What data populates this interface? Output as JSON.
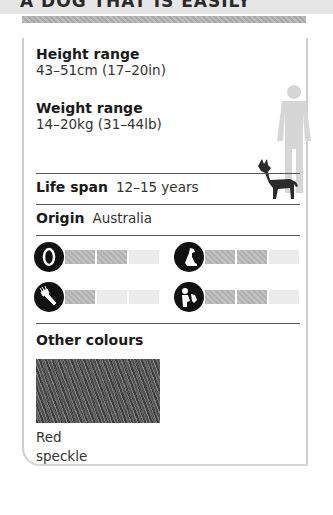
{
  "header": {
    "title_partial": "A DOG THAT IS EASILY"
  },
  "card": {
    "height_range": {
      "label": "Height range",
      "value": "43–51cm (17–20in)"
    },
    "weight_range": {
      "label": "Weight range",
      "value": "14–20kg (31–44lb)"
    },
    "life_span": {
      "label": "Life span",
      "value": "12–15 years"
    },
    "origin": {
      "label": "Origin",
      "value": "Australia"
    },
    "ratings": [
      {
        "icon": "food-bowl-icon",
        "filled": 2,
        "total": 3
      },
      {
        "icon": "sitting-dog-icon",
        "filled": 2,
        "total": 3
      },
      {
        "icon": "grooming-comb-icon",
        "filled": 1,
        "total": 3
      },
      {
        "icon": "child-with-dog-icon",
        "filled": 2,
        "total": 3
      }
    ],
    "other_colours": {
      "label": "Other colours",
      "swatches": [
        {
          "name_line1": "Red",
          "name_line2": "speckle"
        }
      ]
    }
  },
  "colors": {
    "bar_filled": "#b8b8b8",
    "bar_empty": "#ececec",
    "icon_bg": "#111111",
    "silhouette_human": "#d6d6d6",
    "silhouette_dog": "#2b2b2b"
  }
}
